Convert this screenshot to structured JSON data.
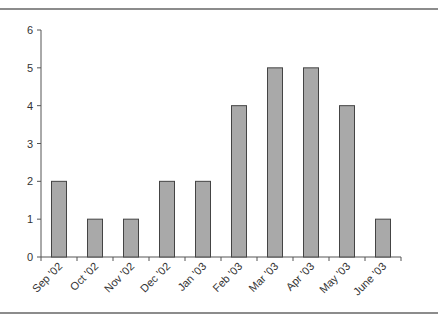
{
  "page": {
    "top_text_fragment": "",
    "background": "#ffffff"
  },
  "chart_data": {
    "type": "bar",
    "title": "",
    "xlabel": "",
    "ylabel": "",
    "categories": [
      "Sep '02",
      "Oct '02",
      "Nov '02",
      "Dec '02",
      "Jan '03",
      "Feb '03",
      "Mar '03",
      "Apr '03",
      "May '03",
      "June '03"
    ],
    "values": [
      2,
      1,
      1,
      2,
      2,
      4,
      5,
      5,
      4,
      1
    ],
    "ylim": [
      0,
      6
    ],
    "yticks": [
      0,
      1,
      2,
      3,
      4,
      5,
      6
    ],
    "grid": false,
    "legend": null,
    "bar_color": "#a9a9a9",
    "bar_edge_color": "#444444"
  }
}
